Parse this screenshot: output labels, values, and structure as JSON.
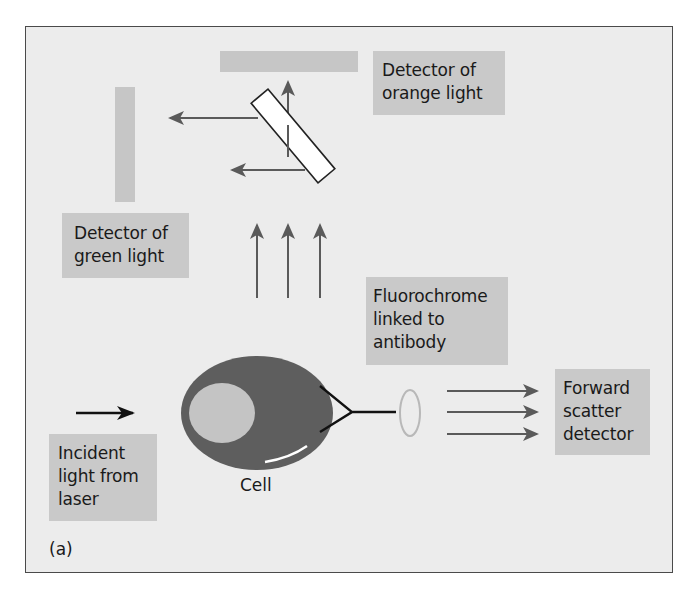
{
  "figure": {
    "panel_label": "(a)",
    "colors": {
      "background": "#ececec",
      "label_box": "#c9c9c9",
      "detector_bar": "#c6c6c6",
      "arrow": "#5a5a5a",
      "cell_body": "#5e5e5e",
      "nucleus": "#c4c4c4",
      "laser_arrow": "#111111"
    },
    "labels": {
      "orange_detector": "Detector of\norange light",
      "green_detector": "Detector of\ngreen light",
      "fluorochrome": "Fluorochrome\nlinked to\nantibody",
      "forward_scatter": "Forward\nscatter\ndetector",
      "incident_light": "Incident\nlight from\nlaser",
      "cell": "Cell"
    },
    "components": [
      {
        "name": "orange-light-detector",
        "shape": "horizontal bar"
      },
      {
        "name": "green-light-detector",
        "shape": "vertical bar"
      },
      {
        "name": "dichroic-mirror",
        "shape": "diagonal rectangle"
      },
      {
        "name": "fluorescence-arrows",
        "count": 3,
        "direction": "up"
      },
      {
        "name": "forward-scatter-arrows",
        "count": 3,
        "direction": "right"
      },
      {
        "name": "laser-arrow",
        "count": 1,
        "direction": "right"
      },
      {
        "name": "cell",
        "shape": "ellipse with nucleus"
      },
      {
        "name": "antibody",
        "shape": "Y-shape"
      },
      {
        "name": "fluorochrome",
        "shape": "small ellipse"
      }
    ]
  }
}
